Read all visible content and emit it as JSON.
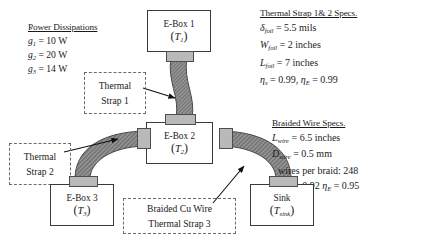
{
  "diagram": {
    "power": {
      "heading": "Power Dissipations",
      "items": [
        {
          "sym": "g",
          "idx": "1",
          "value": "= 10 W"
        },
        {
          "sym": "g",
          "idx": "2",
          "value": "= 20 W"
        },
        {
          "sym": "g",
          "idx": "3",
          "value": "= 14 W"
        }
      ]
    },
    "strap_specs": {
      "heading": "Thermal Strap 1& 2 Specs.",
      "lines": [
        {
          "sym": "δ",
          "sub": "foil",
          "rest": " = 5.5 mils"
        },
        {
          "sym": "W",
          "sub": "foil",
          "rest": " = 2 inches"
        },
        {
          "sym": "L",
          "sub": "foil",
          "rest": " = 7 inches"
        }
      ],
      "eta_line": {
        "eta1": "η",
        "sub1": "s",
        "val1": " = 0.99",
        "sep": ",",
        "eta2": "η",
        "sub2": "E",
        "val2": " = 0.99"
      }
    },
    "wire_specs": {
      "heading": "Braided Wire Specs.",
      "lines": [
        {
          "sym": "L",
          "sub": "wire",
          "rest": " = 6.5 inches"
        },
        {
          "sym": "D",
          "sub": "wire",
          "rest": " = 0.5 mm"
        }
      ],
      "count_line": "wires per braid: 248",
      "eta_line": {
        "eta1": "η",
        "sub1": "s",
        "val1": " = 0.92",
        "eta2": "η",
        "sub2": "E",
        "val2": " = 0.95"
      }
    },
    "boxes": [
      {
        "id": "ebox1",
        "label": "E-Box 1",
        "temp": "T",
        "temp_sub": "1"
      },
      {
        "id": "ebox2",
        "label": "E-Box 2",
        "temp": "T",
        "temp_sub": "2"
      },
      {
        "id": "ebox3",
        "label": "E-Box 3",
        "temp": "T",
        "temp_sub": "3"
      },
      {
        "id": "sink",
        "label": "Sink",
        "temp": "T",
        "temp_sub": "sink"
      }
    ],
    "callouts": [
      {
        "id": "strap1",
        "line1": "Thermal",
        "line2": "Strap 1"
      },
      {
        "id": "strap2",
        "line1": "Thermal",
        "line2": "Strap 2"
      },
      {
        "id": "strap3",
        "line1": "Braided Cu Wire",
        "line2": "Thermal Strap 3"
      }
    ],
    "colors": {
      "ink": "#1a1a1a",
      "box_border": "#3a3a3a",
      "callout_border": "#6b6b6b",
      "tab_fill": "#b9b9b9",
      "strap_fill": "#8f8f8f",
      "strap_edge": "#4a4a4a"
    }
  }
}
